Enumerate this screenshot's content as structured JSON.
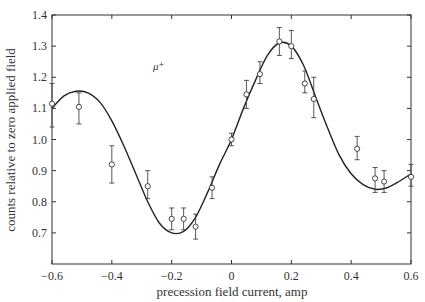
{
  "chart_data": {
    "type": "scatter",
    "title": "",
    "xlabel": "precession field current, amp",
    "ylabel": "counts relative to zero applied field",
    "xlim": [
      -0.6,
      0.6
    ],
    "ylim": [
      0.6,
      1.4
    ],
    "grid": false,
    "legend": null,
    "x_ticks": [
      -0.6,
      -0.4,
      -0.2,
      0,
      0.2,
      0.4,
      0.6
    ],
    "x_tick_labels": [
      "−0.6",
      "−0.4",
      "−0.2",
      "0",
      "0.2",
      "0.4",
      "0.6"
    ],
    "y_ticks": [
      0.7,
      0.8,
      0.9,
      1.0,
      1.1,
      1.2,
      1.3,
      1.4
    ],
    "y_tick_labels": [
      "0.7",
      "0.8",
      "0.9",
      "1.0",
      "1.1",
      "1.2",
      "1.3",
      "1.4"
    ],
    "annotations": [
      {
        "text": "μ⁺",
        "x": -0.25,
        "y": 1.16
      }
    ],
    "series": [
      {
        "name": "measured",
        "style": "open-circle-with-errorbars",
        "points": [
          {
            "x": -0.6,
            "y": 1.115,
            "err_low": 1.04,
            "err_high": 1.18
          },
          {
            "x": -0.51,
            "y": 1.105,
            "err_low": 1.05,
            "err_high": 1.15
          },
          {
            "x": -0.4,
            "y": 0.92,
            "err_low": 0.86,
            "err_high": 0.98
          },
          {
            "x": -0.28,
            "y": 0.85,
            "err_low": 0.81,
            "err_high": 0.9
          },
          {
            "x": -0.2,
            "y": 0.745,
            "err_low": 0.71,
            "err_high": 0.78
          },
          {
            "x": -0.16,
            "y": 0.745,
            "err_low": 0.71,
            "err_high": 0.78
          },
          {
            "x": -0.12,
            "y": 0.72,
            "err_low": 0.68,
            "err_high": 0.76
          },
          {
            "x": -0.065,
            "y": 0.845,
            "err_low": 0.81,
            "err_high": 0.88
          },
          {
            "x": 0.0,
            "y": 1.0,
            "err_low": 0.98,
            "err_high": 1.02
          },
          {
            "x": 0.05,
            "y": 1.145,
            "err_low": 1.1,
            "err_high": 1.19
          },
          {
            "x": 0.095,
            "y": 1.21,
            "err_low": 1.18,
            "err_high": 1.25
          },
          {
            "x": 0.16,
            "y": 1.315,
            "err_low": 1.27,
            "err_high": 1.36
          },
          {
            "x": 0.2,
            "y": 1.3,
            "err_low": 1.26,
            "err_high": 1.35
          },
          {
            "x": 0.245,
            "y": 1.18,
            "err_low": 1.15,
            "err_high": 1.22
          },
          {
            "x": 0.275,
            "y": 1.13,
            "err_low": 1.07,
            "err_high": 1.2
          },
          {
            "x": 0.42,
            "y": 0.97,
            "err_low": 0.935,
            "err_high": 1.01
          },
          {
            "x": 0.48,
            "y": 0.875,
            "err_low": 0.83,
            "err_high": 0.91
          },
          {
            "x": 0.51,
            "y": 0.865,
            "err_low": 0.83,
            "err_high": 0.9
          },
          {
            "x": 0.6,
            "y": 0.88,
            "err_low": 0.85,
            "err_high": 0.92
          }
        ]
      },
      {
        "name": "fit",
        "style": "solid-line",
        "x": [
          -0.6,
          -0.56,
          -0.52,
          -0.48,
          -0.44,
          -0.4,
          -0.36,
          -0.32,
          -0.28,
          -0.24,
          -0.2,
          -0.16,
          -0.12,
          -0.08,
          -0.04,
          0.0,
          0.04,
          0.08,
          0.12,
          0.16,
          0.2,
          0.24,
          0.28,
          0.32,
          0.36,
          0.4,
          0.44,
          0.48,
          0.52,
          0.56,
          0.6
        ],
        "y": [
          1.1,
          1.14,
          1.155,
          1.15,
          1.12,
          1.06,
          0.98,
          0.89,
          0.8,
          0.73,
          0.7,
          0.705,
          0.75,
          0.83,
          0.92,
          1.0,
          1.1,
          1.19,
          1.27,
          1.31,
          1.3,
          1.24,
          1.14,
          1.04,
          0.95,
          0.89,
          0.855,
          0.84,
          0.845,
          0.865,
          0.89
        ]
      }
    ]
  }
}
